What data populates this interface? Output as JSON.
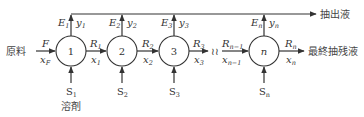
{
  "diagram": {
    "type": "multistage-crosscurrent-extraction",
    "colors": {
      "stroke": "#333333",
      "text": "#333333",
      "background": "#ffffff"
    },
    "feed": {
      "label_jp": "原料",
      "flow": "F",
      "composition": "x",
      "composition_sub": "F"
    },
    "stages": [
      {
        "id": "1",
        "label": "1",
        "E": "E",
        "E_sub": "1",
        "y": "y",
        "y_sub": "1",
        "S": "S",
        "S_sub": "1",
        "R": "R",
        "R_sub": "1",
        "x": "x",
        "x_sub": "1"
      },
      {
        "id": "2",
        "label": "2",
        "E": "E",
        "E_sub": "2",
        "y": "y",
        "y_sub": "2",
        "S": "S",
        "S_sub": "2",
        "R": "R",
        "R_sub": "2",
        "x": "x",
        "x_sub": "2"
      },
      {
        "id": "3",
        "label": "3",
        "E": "E",
        "E_sub": "3",
        "y": "y",
        "y_sub": "3",
        "S": "S",
        "S_sub": "3",
        "R": "R",
        "R_sub": "3",
        "x": "x",
        "x_sub": "3"
      },
      {
        "id": "n",
        "label": "n",
        "E": "E",
        "E_sub": "n",
        "y": "y",
        "y_sub": "n",
        "S": "S",
        "S_sub": "n",
        "R": "R",
        "R_sub": "n",
        "x": "x",
        "x_sub": "n"
      }
    ],
    "pre_n_stream": {
      "R": "R",
      "R_sub": "n−1",
      "x": "x",
      "x_sub": "n−1"
    },
    "break_symbol": "≀≀",
    "solvent_label_jp": "溶剤",
    "extract_label_jp": "抽出液",
    "final_raffinate_label_jp": "最終抽残液"
  }
}
